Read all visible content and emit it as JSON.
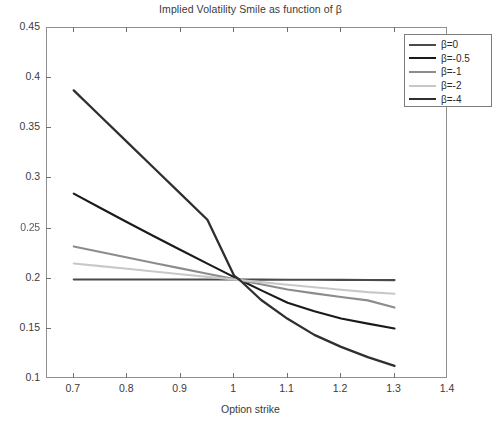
{
  "chart_data": {
    "type": "line",
    "title": "Implied Volatility Smile as function of β",
    "xlabel": "Option strike",
    "ylabel": "",
    "xlim": [
      0.65,
      1.4
    ],
    "ylim": [
      0.1,
      0.45
    ],
    "xticks": [
      "0.7",
      "0.8",
      "0.9",
      "1",
      "1.1",
      "1.2",
      "1.3",
      "1.4"
    ],
    "xtick_values": [
      0.7,
      0.8,
      0.9,
      1.0,
      1.1,
      1.2,
      1.3,
      1.4
    ],
    "yticks": [
      "0.1",
      "0.15",
      "0.2",
      "0.25",
      "0.3",
      "0.35",
      "0.4",
      "0.45"
    ],
    "ytick_values": [
      0.1,
      0.15,
      0.2,
      0.25,
      0.3,
      0.35,
      0.4,
      0.45
    ],
    "grid": false,
    "legend_position": "top-right",
    "x": [
      0.7,
      0.75,
      0.8,
      0.85,
      0.9,
      0.95,
      1.0,
      1.01,
      1.05,
      1.1,
      1.15,
      1.2,
      1.25,
      1.3
    ],
    "series": [
      {
        "name": "β=0",
        "color": "#4a4a4a",
        "linewidth": 2.1,
        "values": [
          0.1992,
          0.1992,
          0.1992,
          0.1992,
          0.1992,
          0.1992,
          0.1992,
          0.1992,
          0.1991,
          0.199,
          0.1989,
          0.1988,
          0.1987,
          0.1986
        ]
      },
      {
        "name": "β=-0.5",
        "color": "#1a1a1a",
        "linewidth": 2.1,
        "values": [
          0.2848,
          0.2705,
          0.2563,
          0.2423,
          0.2286,
          0.215,
          0.2016,
          0.199,
          0.1886,
          0.176,
          0.1676,
          0.1604,
          0.1552,
          0.1503
        ]
      },
      {
        "name": "β=-1",
        "color": "#8c8c8c",
        "linewidth": 2.1,
        "values": [
          0.2322,
          0.2266,
          0.2211,
          0.2157,
          0.2103,
          0.2049,
          0.1996,
          0.1986,
          0.1944,
          0.1893,
          0.1854,
          0.1818,
          0.1784,
          0.1712
        ]
      },
      {
        "name": "β=-2",
        "color": "#c8c8c8",
        "linewidth": 2.1,
        "values": [
          0.2152,
          0.2126,
          0.2099,
          0.2072,
          0.2045,
          0.2018,
          0.1992,
          0.1987,
          0.1966,
          0.194,
          0.1915,
          0.189,
          0.1866,
          0.185
        ]
      },
      {
        "name": "β=-4",
        "color": "#2f2f2f",
        "linewidth": 2.3,
        "values": [
          0.3878,
          0.362,
          0.3362,
          0.3104,
          0.2846,
          0.2588,
          0.203,
          0.199,
          0.179,
          0.16,
          0.144,
          0.132,
          0.1218,
          0.113
        ]
      }
    ]
  },
  "legend": {
    "items": [
      {
        "label": "β=0",
        "color": "#4a4a4a"
      },
      {
        "label": "β=-0.5",
        "color": "#1a1a1a"
      },
      {
        "label": "β=-1",
        "color": "#8c8c8c"
      },
      {
        "label": "β=-2",
        "color": "#c8c8c8"
      },
      {
        "label": "β=-4",
        "color": "#2f2f2f"
      }
    ]
  },
  "footer": {
    "caption": ""
  }
}
